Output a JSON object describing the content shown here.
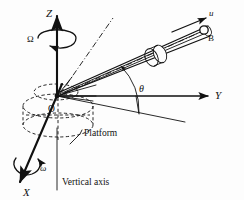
{
  "figure": {
    "background_color": "#fdfdfd",
    "ink_color": "#111111"
  },
  "axes": {
    "z": {
      "label": "Z",
      "name": "vertical-axis",
      "direction": "up"
    },
    "y": {
      "label": "Y",
      "name": "horizontal-axis",
      "direction": "right"
    },
    "x": {
      "label": "X",
      "name": "out-of-plane-axis",
      "direction": "down-left"
    },
    "origin": {
      "label": "O"
    }
  },
  "rotations": {
    "omega_upper": {
      "symbol": "Ω",
      "about": "Z",
      "name": "platform-spin-rate"
    },
    "omega_lower": {
      "symbol": "ω",
      "about": "X",
      "name": "tube-spin-rate"
    }
  },
  "angles": {
    "theta": {
      "symbol": "θ",
      "between": "Y-axis and tube axis"
    }
  },
  "bead": {
    "label": "B",
    "velocity": {
      "symbol": "u",
      "name": "relative-velocity"
    }
  },
  "annotations": {
    "platform": "Platform",
    "vertical_axis": "Vertical axis"
  }
}
